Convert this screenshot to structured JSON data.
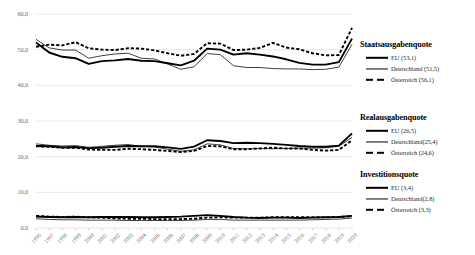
{
  "chart_data": {
    "type": "line",
    "title": "",
    "xlabel": "",
    "ylabel": "",
    "ylim": [
      0,
      60
    ],
    "yticks": [
      "0,0",
      "10,0",
      "20,0",
      "30,0",
      "40,0",
      "50,0",
      "60,0"
    ],
    "ytick_values": [
      0,
      10,
      20,
      30,
      40,
      50,
      60
    ],
    "grid": true,
    "grid_axis": "y",
    "legend_position": "right",
    "x": [
      1996,
      1997,
      1998,
      1999,
      2000,
      2001,
      2002,
      2003,
      2004,
      2005,
      2006,
      2007,
      2008,
      2009,
      2010,
      2011,
      2012,
      2013,
      2014,
      2015,
      2016,
      2017,
      2018,
      2019,
      2020
    ],
    "categories": [
      "1996",
      "1997",
      "1998",
      "1999",
      "2000",
      "2001",
      "2002",
      "2003",
      "2004",
      "2005",
      "2006",
      "2007",
      "2008",
      "2009",
      "2010",
      "2011",
      "2012",
      "2013",
      "2014",
      "2015",
      "2016",
      "2017",
      "2018",
      "2019",
      "2020"
    ],
    "series": [
      {
        "name": "EU (53,1)",
        "group": "Staatsausgabenquote",
        "style": "thick-solid",
        "values": [
          52.0,
          49.2,
          48.0,
          47.6,
          46.0,
          46.8,
          47.0,
          47.4,
          46.9,
          46.8,
          46.2,
          45.6,
          46.9,
          50.3,
          50.0,
          48.6,
          49.0,
          48.6,
          48.1,
          47.3,
          46.3,
          45.8,
          45.8,
          46.5,
          53.1
        ]
      },
      {
        "name": "Deutschland (51,5)",
        "group": "Staatsausgabenquote",
        "style": "thin-solid",
        "values": [
          52.9,
          50.5,
          49.9,
          49.9,
          47.6,
          48.3,
          48.8,
          49.0,
          47.6,
          47.4,
          46.0,
          44.5,
          45.2,
          48.9,
          48.6,
          45.5,
          45.0,
          45.0,
          44.7,
          44.6,
          44.6,
          44.4,
          44.5,
          45.1,
          51.5
        ]
      },
      {
        "name": "Österreich (56,1)",
        "group": "Staatsausgabenquote",
        "style": "thick-dashed",
        "values": [
          50.8,
          51.4,
          51.2,
          52.1,
          50.4,
          50.0,
          49.9,
          50.4,
          50.3,
          49.8,
          49.0,
          48.3,
          48.8,
          51.8,
          51.7,
          49.9,
          50.0,
          50.5,
          51.9,
          50.6,
          50.1,
          49.0,
          48.4,
          48.5,
          56.1
        ]
      },
      {
        "name": "EU (26,5)",
        "group": "Realausgabenquote",
        "style": "thick-solid",
        "values": [
          23.0,
          22.9,
          22.6,
          22.7,
          22.4,
          22.5,
          22.8,
          23.0,
          22.9,
          22.9,
          22.6,
          22.2,
          22.8,
          24.6,
          24.4,
          23.8,
          23.9,
          23.8,
          23.6,
          23.3,
          23.0,
          22.8,
          22.8,
          23.1,
          26.5
        ]
      },
      {
        "name": "Deutschland (25,4)",
        "group": "Realausgabenquote",
        "style": "thin-solid",
        "values": [
          23.6,
          23.2,
          23.0,
          23.1,
          22.6,
          22.9,
          23.2,
          23.4,
          22.9,
          22.7,
          22.1,
          21.5,
          21.9,
          23.6,
          23.3,
          22.3,
          22.2,
          22.3,
          22.2,
          22.3,
          22.4,
          22.4,
          22.5,
          22.9,
          25.4
        ]
      },
      {
        "name": "Österreich (24,6)",
        "group": "Realausgabenquote",
        "style": "thick-dashed",
        "values": [
          22.9,
          22.8,
          22.5,
          22.5,
          22.0,
          21.9,
          21.9,
          22.2,
          22.1,
          21.9,
          21.6,
          21.3,
          21.6,
          23.0,
          22.9,
          22.1,
          22.1,
          22.3,
          22.5,
          22.3,
          22.3,
          21.9,
          21.7,
          21.9,
          24.6
        ]
      },
      {
        "name": "EU (3,4)",
        "group": "Investitionsquote",
        "style": "thick-solid",
        "values": [
          3.2,
          3.1,
          3.0,
          3.1,
          3.0,
          3.1,
          3.1,
          3.1,
          3.0,
          3.0,
          3.1,
          3.2,
          3.4,
          3.6,
          3.4,
          3.1,
          2.9,
          2.8,
          2.9,
          2.9,
          2.8,
          2.9,
          3.0,
          3.1,
          3.4
        ]
      },
      {
        "name": "Deutschland (2,8)",
        "group": "Investitionsquote",
        "style": "thin-solid",
        "values": [
          2.6,
          2.4,
          2.3,
          2.3,
          2.2,
          2.2,
          2.2,
          2.1,
          2.1,
          2.1,
          2.1,
          2.1,
          2.2,
          2.4,
          2.4,
          2.2,
          2.2,
          2.2,
          2.2,
          2.2,
          2.2,
          2.3,
          2.4,
          2.5,
          2.8
        ]
      },
      {
        "name": "Österreich (3,3)",
        "group": "Investitionsquote",
        "style": "thick-dashed",
        "values": [
          3.4,
          3.2,
          3.1,
          3.2,
          3.0,
          2.9,
          2.7,
          2.6,
          2.6,
          2.5,
          2.5,
          2.5,
          2.6,
          2.9,
          3.0,
          2.9,
          2.9,
          2.9,
          3.0,
          3.0,
          3.0,
          3.0,
          3.0,
          3.1,
          3.3
        ]
      }
    ]
  },
  "legend": {
    "groups": [
      {
        "title": "Staatsausgabenquote",
        "entries": [
          {
            "label": "EU (53,1)",
            "style": "thick-solid"
          },
          {
            "label": "Deutschland (51,5)",
            "style": "thin-solid"
          },
          {
            "label": "Österreich (56,1)",
            "style": "thick-dashed"
          }
        ]
      },
      {
        "title": "Realausgabenquote",
        "entries": [
          {
            "label": "EU (26,5)",
            "style": "thick-solid"
          },
          {
            "label": "Deutschland(25,4)",
            "style": "thin-solid"
          },
          {
            "label": "Österreich (24,6)",
            "style": "thick-dashed"
          }
        ]
      },
      {
        "title": "Investitionsquote",
        "entries": [
          {
            "label": "EU (3,4)",
            "style": "thick-solid"
          },
          {
            "label": "Deutschland(2,8)",
            "style": "thin-solid"
          },
          {
            "label": "Österreich (3,3)",
            "style": "thick-dashed"
          }
        ]
      }
    ]
  },
  "colors": {
    "line": "#000000",
    "grid": "#e2e2e2",
    "axis_text": "#6b6b6b",
    "background": "#ffffff"
  }
}
